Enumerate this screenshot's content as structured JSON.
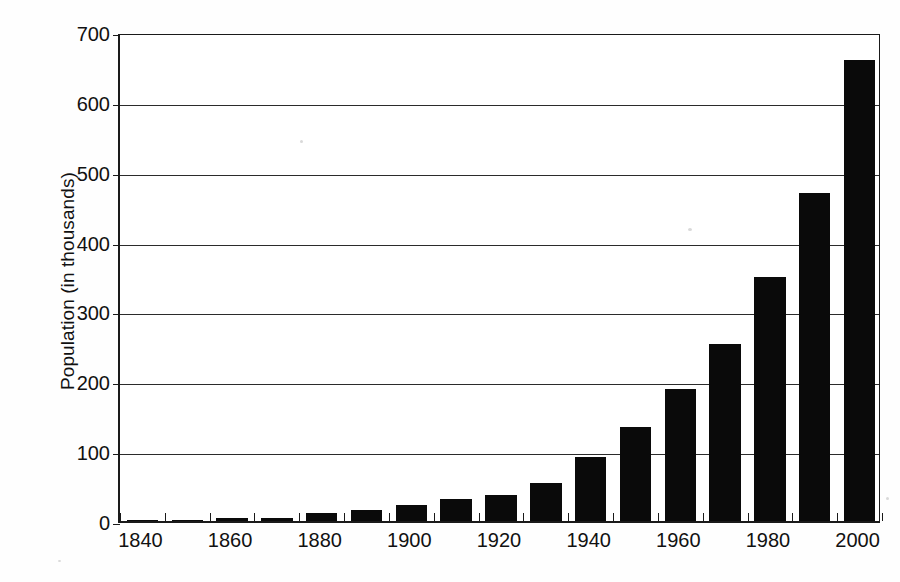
{
  "chart_data": {
    "type": "bar",
    "title": "",
    "xlabel": "",
    "ylabel": "Population (in thousands)",
    "categories": [
      "1840",
      "1850",
      "1860",
      "1870",
      "1880",
      "1890",
      "1900",
      "1910",
      "1920",
      "1930",
      "1940",
      "1950",
      "1960",
      "1970",
      "1980",
      "1990",
      "2000"
    ],
    "values": [
      1,
      2,
      4,
      5,
      12,
      16,
      23,
      32,
      37,
      55,
      91,
      134,
      189,
      254,
      349,
      469,
      660
    ],
    "series": [
      {
        "name": "Population",
        "values": [
          1,
          2,
          4,
          5,
          12,
          16,
          23,
          32,
          37,
          55,
          91,
          134,
          189,
          254,
          349,
          469,
          660
        ]
      }
    ],
    "ylim": [
      0,
      700
    ],
    "y_ticks": [
      0,
      100,
      200,
      300,
      400,
      500,
      600,
      700
    ],
    "y_tick_labels": [
      "0",
      "100",
      "200",
      "300",
      "400",
      "500",
      "600",
      "700"
    ],
    "x_tick_labels": [
      "1840",
      "1860",
      "1880",
      "1900",
      "1920",
      "1940",
      "1960",
      "1980",
      "2000"
    ],
    "x_labeled_indices": [
      0,
      2,
      4,
      6,
      8,
      10,
      12,
      14,
      16
    ],
    "grid": true,
    "grid_axis": "y",
    "legend": false,
    "legend_position": "none",
    "bar_color": "#0a0a0a",
    "axis_color": "#1a1a1a",
    "background_color": "#ffffff"
  }
}
